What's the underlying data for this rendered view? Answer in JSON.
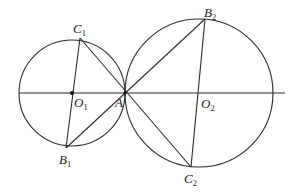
{
  "diagram": {
    "type": "geometry",
    "axis_line": {
      "x1": 19,
      "y1": 93,
      "x2": 285,
      "y2": 93
    },
    "circles": [
      {
        "name": "circle-o1",
        "cx": 72,
        "cy": 93,
        "r": 53
      },
      {
        "name": "circle-o2",
        "cx": 199,
        "cy": 93,
        "r": 74
      }
    ],
    "points": {
      "C1": {
        "x": 80,
        "y": 38
      },
      "B1": {
        "x": 66,
        "y": 148
      },
      "O1": {
        "x": 72,
        "y": 93
      },
      "A": {
        "x": 125,
        "y": 93
      },
      "B2": {
        "x": 205,
        "y": 19
      },
      "O2": {
        "x": 199,
        "y": 93
      },
      "C2": {
        "x": 191,
        "y": 167
      }
    },
    "segments": [
      [
        "C1",
        "B1"
      ],
      [
        "C1",
        "C2"
      ],
      [
        "B1",
        "B2"
      ],
      [
        "B2",
        "C2"
      ]
    ],
    "labels": {
      "C1": {
        "main": "C",
        "sub": "1"
      },
      "B1": {
        "main": "B",
        "sub": "1"
      },
      "O1": {
        "main": "O",
        "sub": "1"
      },
      "A": {
        "main": "A",
        "sub": ""
      },
      "B2": {
        "main": "B",
        "sub": "2"
      },
      "O2": {
        "main": "O",
        "sub": "2"
      },
      "C2": {
        "main": "C",
        "sub": "2"
      }
    }
  }
}
